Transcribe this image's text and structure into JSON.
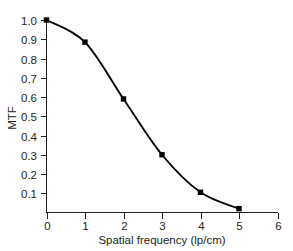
{
  "chart_data": {
    "type": "line",
    "title": "",
    "subtitle": "",
    "xlabel": "Spatial frequency (lp/cm)",
    "ylabel": "MTF",
    "x": [
      0,
      1,
      2,
      3,
      4,
      5
    ],
    "values": [
      1.0,
      0.885,
      0.59,
      0.3,
      0.105,
      0.02
    ],
    "series": [
      {
        "name": "MTF",
        "x": [
          0,
          1,
          2,
          3,
          4,
          5
        ],
        "values": [
          1.0,
          0.885,
          0.59,
          0.3,
          0.105,
          0.02
        ],
        "marker": "square",
        "color": "#000000",
        "line_style": "solid"
      }
    ],
    "xlim": [
      0,
      6
    ],
    "ylim": [
      0,
      1.04
    ],
    "xticks": [
      0,
      1,
      2,
      3,
      4,
      5,
      6
    ],
    "xticklabels": [
      "0",
      "1",
      "2",
      "3",
      "4",
      "5",
      "6"
    ],
    "yticks": [
      0.1,
      0.2,
      0.3,
      0.4,
      0.5,
      0.6,
      0.7,
      0.8,
      0.9,
      1.0
    ],
    "yticklabels": [
      "0.1",
      "0.2",
      "0.3",
      "0.4",
      "0.5",
      "0.6",
      "0.7",
      "0.8",
      "0.9",
      "1.0"
    ],
    "grid": false,
    "legend": null,
    "legend_position": "none",
    "annotations": [],
    "axis_color": "#231f20",
    "background_color": "#ffffff"
  },
  "axes": {
    "x_axis_label": "Spatial frequency (lp/cm)",
    "y_axis_label": "MTF"
  }
}
